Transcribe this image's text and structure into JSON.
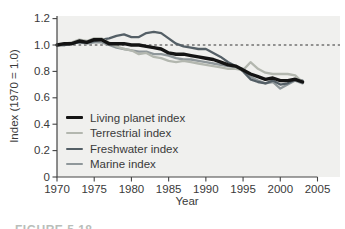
{
  "figure": {
    "caption_partial": "FIGURE 5.18"
  },
  "chart_data": {
    "type": "line",
    "title": "",
    "xlabel": "Year",
    "ylabel": "Index (1970 = 1.0)",
    "xlim": [
      1970,
      2005
    ],
    "ylim": [
      0,
      1.2
    ],
    "grid": false,
    "legend_position": "lower-left-inside",
    "plot_bg": "#f0f0ee",
    "axis_color": "#444444",
    "x_tick_values": [
      1970,
      1975,
      1980,
      1985,
      1990,
      1995,
      2000,
      2005
    ],
    "x_tick_labels": [
      "1970",
      "1975",
      "1980",
      "1985",
      "1990",
      "1995",
      "2000",
      "2005"
    ],
    "y_tick_values": [
      0,
      0.2,
      0.4,
      0.6,
      0.8,
      1.0,
      1.2
    ],
    "y_tick_labels": [
      "0",
      "0.2",
      "0.4",
      "0.6",
      "0.8",
      "1.0",
      "1.2"
    ],
    "reference_line": {
      "value": 1.0,
      "style": "dashed",
      "color": "#333333"
    },
    "x": [
      1970,
      1971,
      1972,
      1973,
      1974,
      1975,
      1976,
      1977,
      1978,
      1979,
      1980,
      1981,
      1982,
      1983,
      1984,
      1985,
      1986,
      1987,
      1988,
      1989,
      1990,
      1991,
      1992,
      1993,
      1994,
      1995,
      1996,
      1997,
      1998,
      1999,
      2000,
      2001,
      2002,
      2003
    ],
    "series": [
      {
        "name": "Living planet index",
        "color": "#141414",
        "line_width": 3.4,
        "values": [
          1.0,
          1.01,
          1.01,
          1.03,
          1.02,
          1.04,
          1.04,
          1.01,
          1.01,
          1.01,
          1.0,
          1.0,
          0.99,
          0.98,
          0.97,
          0.94,
          0.93,
          0.93,
          0.92,
          0.91,
          0.9,
          0.89,
          0.87,
          0.85,
          0.84,
          0.81,
          0.78,
          0.76,
          0.74,
          0.75,
          0.73,
          0.73,
          0.74,
          0.72
        ]
      },
      {
        "name": "Terrestrial index",
        "color": "#b3b7af",
        "line_width": 2.3,
        "values": [
          1.0,
          1.01,
          1.02,
          1.04,
          1.03,
          1.05,
          1.05,
          1.02,
          0.99,
          0.97,
          0.96,
          0.93,
          0.94,
          0.91,
          0.9,
          0.88,
          0.87,
          0.88,
          0.87,
          0.86,
          0.85,
          0.84,
          0.83,
          0.82,
          0.82,
          0.81,
          0.87,
          0.82,
          0.79,
          0.78,
          0.78,
          0.78,
          0.77,
          0.72
        ]
      },
      {
        "name": "Freshwater index",
        "color": "#545f66",
        "line_width": 2.3,
        "values": [
          1.0,
          1.0,
          1.01,
          1.02,
          1.02,
          1.03,
          1.04,
          1.05,
          1.07,
          1.08,
          1.06,
          1.06,
          1.09,
          1.1,
          1.09,
          1.05,
          1.01,
          0.99,
          0.98,
          0.97,
          0.97,
          0.94,
          0.91,
          0.87,
          0.84,
          0.8,
          0.74,
          0.72,
          0.71,
          0.73,
          0.7,
          0.71,
          0.74,
          0.73
        ]
      },
      {
        "name": "Marine index",
        "color": "#8f979a",
        "line_width": 2.3,
        "values": [
          1.0,
          1.0,
          1.01,
          1.02,
          1.01,
          1.02,
          1.02,
          1.0,
          0.98,
          0.97,
          0.96,
          0.95,
          0.95,
          0.93,
          0.93,
          0.92,
          0.9,
          0.89,
          0.89,
          0.88,
          0.87,
          0.86,
          0.85,
          0.84,
          0.83,
          0.82,
          0.76,
          0.73,
          0.71,
          0.72,
          0.67,
          0.7,
          0.73,
          0.71
        ]
      }
    ]
  }
}
